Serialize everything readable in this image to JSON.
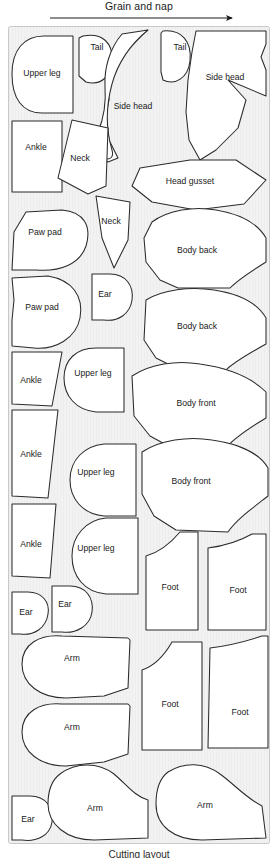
{
  "header": {
    "grain_label": "Grain and nap",
    "arrow_direction": "right"
  },
  "caption": {
    "text": "Cutting layout"
  },
  "colors": {
    "fabric_background": "#f2f2f2",
    "piece_fill": "#ffffff",
    "piece_outline": "#2b2b2b",
    "panel_border": "#c9c9c9",
    "text": "#1a1a1a"
  },
  "panel": {
    "x": 8,
    "y": 26,
    "width": 262,
    "height": 818
  },
  "pieces": [
    {
      "id": "upper-leg-1",
      "label": "Upper leg",
      "lx": 42,
      "ly": 74
    },
    {
      "id": "tail-1",
      "label": "Tail",
      "lx": 97,
      "ly": 48
    },
    {
      "id": "side-head-1",
      "label": "Side head",
      "lx": 133,
      "ly": 107
    },
    {
      "id": "tail-2",
      "label": "Tail",
      "lx": 180,
      "ly": 48
    },
    {
      "id": "side-head-2",
      "label": "Side head",
      "lx": 225,
      "ly": 78
    },
    {
      "id": "ankle-1",
      "label": "Ankle",
      "lx": 36,
      "ly": 148
    },
    {
      "id": "neck-1",
      "label": "Neck",
      "lx": 80,
      "ly": 159
    },
    {
      "id": "head-gusset",
      "label": "Head gusset",
      "lx": 190,
      "ly": 182
    },
    {
      "id": "paw-pad-1",
      "label": "Paw pad",
      "lx": 45,
      "ly": 233
    },
    {
      "id": "neck-2",
      "label": "Neck",
      "lx": 111,
      "ly": 222
    },
    {
      "id": "body-back-1",
      "label": "Body back",
      "lx": 197,
      "ly": 251
    },
    {
      "id": "ear-1",
      "label": "Ear",
      "lx": 105,
      "ly": 295
    },
    {
      "id": "paw-pad-2",
      "label": "Paw pad",
      "lx": 42,
      "ly": 308
    },
    {
      "id": "body-back-2",
      "label": "Body back",
      "lx": 197,
      "ly": 327
    },
    {
      "id": "ankle-2",
      "label": "Ankle",
      "lx": 31,
      "ly": 381
    },
    {
      "id": "upper-leg-2",
      "label": "Upper leg",
      "lx": 93,
      "ly": 374
    },
    {
      "id": "body-front-1",
      "label": "Body front",
      "lx": 196,
      "ly": 404
    },
    {
      "id": "ankle-3",
      "label": "Ankle",
      "lx": 31,
      "ly": 455
    },
    {
      "id": "upper-leg-3",
      "label": "Upper leg",
      "lx": 96,
      "ly": 473
    },
    {
      "id": "body-front-2",
      "label": "Body front",
      "lx": 191,
      "ly": 482
    },
    {
      "id": "ankle-4",
      "label": "Ankle",
      "lx": 31,
      "ly": 545
    },
    {
      "id": "upper-leg-4",
      "label": "Upper leg",
      "lx": 96,
      "ly": 549
    },
    {
      "id": "foot-1",
      "label": "Foot",
      "lx": 170,
      "ly": 588
    },
    {
      "id": "foot-2",
      "label": "Foot",
      "lx": 238,
      "ly": 591
    },
    {
      "id": "ear-2",
      "label": "Ear",
      "lx": 26,
      "ly": 613
    },
    {
      "id": "ear-3",
      "label": "Ear",
      "lx": 65,
      "ly": 605
    },
    {
      "id": "arm-1",
      "label": "Arm",
      "lx": 72,
      "ly": 659
    },
    {
      "id": "foot-3",
      "label": "Foot",
      "lx": 170,
      "ly": 705
    },
    {
      "id": "foot-4",
      "label": "Foot",
      "lx": 240,
      "ly": 713
    },
    {
      "id": "arm-2",
      "label": "Arm",
      "lx": 72,
      "ly": 728
    },
    {
      "id": "ear-4",
      "label": "Ear",
      "lx": 28,
      "ly": 820
    },
    {
      "id": "arm-3",
      "label": "Arm",
      "lx": 95,
      "ly": 809
    },
    {
      "id": "arm-4",
      "label": "Arm",
      "lx": 205,
      "ly": 806
    }
  ]
}
